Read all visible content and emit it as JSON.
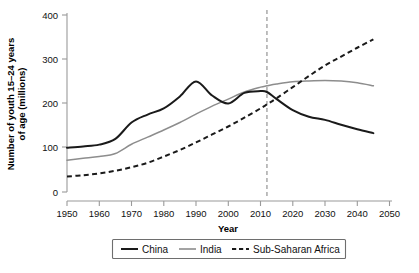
{
  "chart_data": {
    "type": "line",
    "title": "",
    "xlabel": "Year",
    "ylabel": "Number of youth 15–24 years of age (millions)",
    "ylabel_line1": "Number of youth 15–24 years",
    "ylabel_line2": "of age (millions)",
    "xlim": [
      1950,
      2050
    ],
    "ylim": [
      0,
      400
    ],
    "xticks": [
      1950,
      1960,
      1970,
      1980,
      1990,
      2000,
      2010,
      2020,
      2030,
      2040,
      2050
    ],
    "yticks": [
      0,
      100,
      200,
      300,
      400
    ],
    "grid": false,
    "legend_position": "bottom-center",
    "annotations": [
      {
        "name": "projection-divider",
        "type": "vertical-dashed-line",
        "x": 2012,
        "label": ""
      }
    ],
    "series": [
      {
        "name": "China",
        "color": "#1a1a1a",
        "style": "solid",
        "x": [
          1950,
          1955,
          1960,
          1965,
          1970,
          1975,
          1980,
          1985,
          1990,
          1995,
          2000,
          2005,
          2010,
          2012,
          2015,
          2020,
          2025,
          2030,
          2035,
          2040,
          2045
        ],
        "values": [
          100,
          103,
          107,
          120,
          157,
          175,
          189,
          216,
          250,
          218,
          200,
          224,
          228,
          226,
          210,
          185,
          170,
          163,
          152,
          142,
          133
        ]
      },
      {
        "name": "India",
        "color": "#8d8d8d",
        "style": "solid",
        "x": [
          1950,
          1955,
          1960,
          1965,
          1970,
          1975,
          1980,
          1985,
          1990,
          1995,
          2000,
          2005,
          2010,
          2012,
          2015,
          2020,
          2025,
          2030,
          2035,
          2040,
          2045
        ],
        "values": [
          72,
          76,
          80,
          87,
          108,
          124,
          140,
          157,
          176,
          194,
          210,
          226,
          237,
          240,
          244,
          249,
          251,
          252,
          251,
          247,
          240
        ]
      },
      {
        "name": "Sub-Saharan Africa",
        "color": "#1a1a1a",
        "style": "dashed",
        "x": [
          1950,
          1955,
          1960,
          1965,
          1970,
          1975,
          1980,
          1985,
          1990,
          1995,
          2000,
          2005,
          2010,
          2012,
          2015,
          2020,
          2025,
          2030,
          2035,
          2040,
          2045
        ],
        "values": [
          35,
          38,
          42,
          48,
          56,
          66,
          80,
          95,
          112,
          130,
          148,
          168,
          189,
          198,
          212,
          237,
          262,
          286,
          306,
          326,
          345
        ]
      }
    ]
  },
  "legend": {
    "items": [
      {
        "label": "China",
        "style": "solid-dark"
      },
      {
        "label": "India",
        "style": "solid-gray"
      },
      {
        "label": "Sub-Saharan Africa",
        "style": "dashed"
      }
    ]
  }
}
